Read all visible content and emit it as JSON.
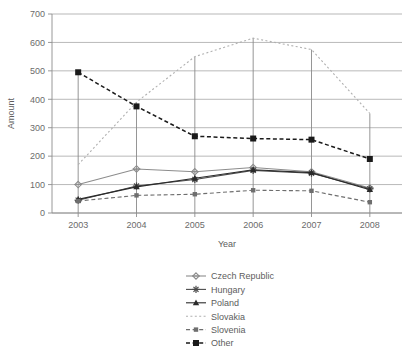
{
  "chart_data": {
    "type": "line",
    "title": "",
    "xlabel": "Year",
    "ylabel": "Amount",
    "categories": [
      "2003",
      "2004",
      "2005",
      "2006",
      "2007",
      "2008"
    ],
    "x": [
      2003,
      2004,
      2005,
      2006,
      2007,
      2008
    ],
    "ylim": [
      0,
      700
    ],
    "ytick_labels": [
      "0",
      "100",
      "200",
      "300",
      "400",
      "500",
      "600",
      "700"
    ],
    "ytick_values": [
      0,
      100,
      200,
      300,
      400,
      500,
      600,
      700
    ],
    "grid": true,
    "legend_position": "bottom",
    "series": [
      {
        "name": "Czech Republic",
        "marker": "diamond-plus-marker",
        "linestyle": "solid",
        "color": "#8c8c8c",
        "values": [
          100,
          155,
          145,
          160,
          145,
          88
        ]
      },
      {
        "name": "Hungary",
        "marker": "asterisk-marker",
        "linestyle": "solid",
        "color": "#4a4a4a",
        "values": [
          45,
          95,
          118,
          150,
          140,
          85
        ]
      },
      {
        "name": "Poland",
        "marker": "triangle-marker",
        "linestyle": "solid",
        "color": "#2b2b2b",
        "values": [
          48,
          92,
          122,
          152,
          142,
          82
        ]
      },
      {
        "name": "Slovakia",
        "marker": "none",
        "linestyle": "dotted",
        "color": "#b0b0b0",
        "values": [
          170,
          390,
          550,
          615,
          575,
          350
        ]
      },
      {
        "name": "Slovenia",
        "marker": "small-square-marker",
        "linestyle": "dashed",
        "color": "#6e6e6e",
        "values": [
          42,
          62,
          66,
          80,
          78,
          38
        ]
      },
      {
        "name": "Other",
        "marker": "bold-square-marker",
        "linestyle": "dashed",
        "color": "#1a1a1a",
        "values": [
          495,
          375,
          270,
          262,
          258,
          190
        ]
      }
    ]
  },
  "legend": {
    "items": [
      {
        "label": "Czech Republic"
      },
      {
        "label": "Hungary"
      },
      {
        "label": "Poland"
      },
      {
        "label": "Slovakia"
      },
      {
        "label": "Slovenia"
      },
      {
        "label": "Other"
      }
    ]
  }
}
